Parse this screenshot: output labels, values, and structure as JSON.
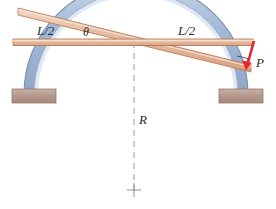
{
  "figure": {
    "background_color": "#ffffff",
    "labels": {
      "span_left": "L/2",
      "angle": "θ",
      "span_right": "L/2",
      "radius": "R",
      "load": "P"
    },
    "colors": {
      "beam_fill": "#e5b89c",
      "beam_highlight": "#f2d6c2",
      "beam_edge": "#b5714a",
      "arch_band": "#9fb6d4",
      "arch_fill": "#dbe6f2",
      "arch_edge": "#6e87ab",
      "support_fill": "#b59a8c",
      "support_edge": "#8a6e60",
      "load_arrow": "#e8262a",
      "dashed_line": "#9a9a9a",
      "text": "#2b2b2b"
    },
    "elements": {
      "horizontal_beam_name": "horizontal-chord-beam",
      "inclined_beam_name": "inclined-beam",
      "arch_name": "circular-arch",
      "left_support_name": "left-support-block",
      "right_support_name": "right-support-block",
      "centerline_name": "vertical-centerline",
      "center_mark_name": "center-cross-mark",
      "load_arrow_name": "load-arrow-P",
      "right_angle_name": "right-angle-marker"
    }
  }
}
